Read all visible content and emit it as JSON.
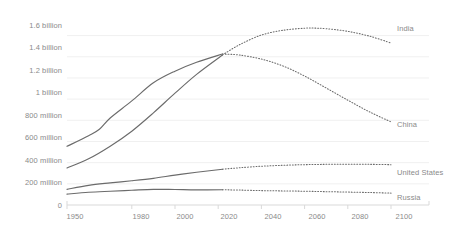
{
  "chart_data": {
    "type": "line",
    "title": "",
    "subtitle": "",
    "xlabel": "",
    "ylabel": "",
    "xlim": [
      1950,
      2100
    ],
    "ylim": [
      0,
      1700000000
    ],
    "grid": true,
    "legend_position": "right-inline-labels",
    "projection_start": 2022,
    "note": "Solid segment is historical (1950-2022); dotted segment is projection (2022-2100).",
    "ytick_labels": [
      "0",
      "200 million",
      "400 million",
      "600 million",
      "800 million",
      "1 billion",
      "1.2 billion",
      "1.4 billion",
      "1.6 billion"
    ],
    "ytick_values": [
      0,
      200000000,
      400000000,
      600000000,
      800000000,
      1000000000,
      1200000000,
      1400000000,
      1600000000
    ],
    "xtick_labels": [
      "1950",
      "1980",
      "2000",
      "2020",
      "2040",
      "2060",
      "2080",
      "2100"
    ],
    "xtick_values": [
      1950,
      1980,
      2000,
      2020,
      2040,
      2060,
      2080,
      2100
    ],
    "series": [
      {
        "name": "India",
        "color": "#6b6b6b",
        "label": "India",
        "x": [
          1950,
          1960,
          1970,
          1980,
          1990,
          2000,
          2010,
          2022,
          2030,
          2040,
          2050,
          2060,
          2064,
          2070,
          2080,
          2090,
          2100
        ],
        "values": [
          350000000,
          436000000,
          555000000,
          697000000,
          870000000,
          1056000000,
          1234000000,
          1417000000,
          1515000000,
          1605000000,
          1650000000,
          1670000000,
          1671000000,
          1665000000,
          1640000000,
          1595000000,
          1530000000
        ]
      },
      {
        "name": "China",
        "color": "#6b6b6b",
        "label": "China",
        "x": [
          1950,
          1960,
          1965,
          1970,
          1980,
          1990,
          2000,
          2010,
          2022,
          2030,
          2040,
          2050,
          2060,
          2070,
          2080,
          2090,
          2100
        ],
        "values": [
          554000000,
          654000000,
          715000000,
          822000000,
          983000000,
          1154000000,
          1264000000,
          1348000000,
          1426000000,
          1416000000,
          1378000000,
          1313000000,
          1218000000,
          1105000000,
          990000000,
          880000000,
          785000000
        ]
      },
      {
        "name": "United States",
        "color": "#6b6b6b",
        "label": "United States",
        "x": [
          1950,
          1960,
          1970,
          1980,
          1990,
          2000,
          2010,
          2022,
          2030,
          2040,
          2050,
          2060,
          2070,
          2080,
          2090,
          2100
        ],
        "values": [
          148000000,
          186000000,
          209000000,
          229000000,
          252000000,
          282000000,
          309000000,
          338000000,
          352000000,
          366000000,
          375000000,
          381000000,
          384000000,
          385000000,
          384000000,
          381000000
        ]
      },
      {
        "name": "Russia",
        "color": "#6b6b6b",
        "label": "Russia",
        "x": [
          1950,
          1960,
          1970,
          1980,
          1990,
          2000,
          2010,
          2022,
          2030,
          2040,
          2050,
          2060,
          2070,
          2080,
          2090,
          2100
        ],
        "values": [
          103000000,
          120000000,
          130000000,
          139000000,
          148000000,
          146000000,
          143000000,
          144000000,
          141000000,
          136000000,
          133000000,
          130000000,
          126000000,
          122000000,
          118000000,
          112000000
        ]
      }
    ]
  },
  "axis": {
    "y_labels": [
      {
        "text": "1.6 billion",
        "top": 21
      },
      {
        "text": "1.4 billion",
        "top": 43
      },
      {
        "text": "1.2 billion",
        "top": 66
      },
      {
        "text": "1 billion",
        "top": 88
      },
      {
        "text": "800 million",
        "top": 111
      },
      {
        "text": "600 million",
        "top": 133
      },
      {
        "text": "400 million",
        "top": 156
      },
      {
        "text": "200 million",
        "top": 178
      },
      {
        "text": "0",
        "top": 201
      }
    ],
    "x_labels": [
      {
        "text": "1950",
        "left": 75
      },
      {
        "text": "1980",
        "left": 141
      },
      {
        "text": "2000",
        "left": 185
      },
      {
        "text": "2020",
        "left": 229
      },
      {
        "text": "2040",
        "left": 273
      },
      {
        "text": "2060",
        "left": 317
      },
      {
        "text": "2080",
        "left": 360
      },
      {
        "text": "2100",
        "left": 404
      }
    ]
  },
  "series_labels": [
    {
      "name": "India",
      "left": 397,
      "top": 24
    },
    {
      "name": "China",
      "left": 397,
      "top": 120
    },
    {
      "name": "United States",
      "left": 397,
      "top": 168
    },
    {
      "name": "Russia",
      "left": 397,
      "top": 193
    }
  ],
  "colors": {
    "line": "#6b6b6b",
    "grid": "#f0f0f0",
    "axis": "#d9d9d9",
    "text": "#8a8a8a",
    "background": "#ffffff"
  }
}
